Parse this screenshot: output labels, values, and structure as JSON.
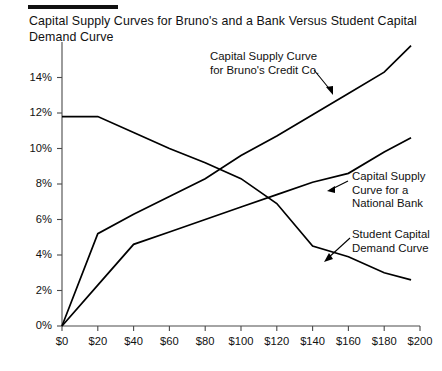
{
  "title": "Capital Supply Curves for Bruno's and a Bank Versus Student Capital Demand Curve",
  "annotations": {
    "bruno": "Capital Supply Curve\nfor Bruno's Credit Co.",
    "bank": "Capital Supply\nCurve for a\nNational Bank",
    "demand": "Student Capital\nDemand Curve"
  },
  "axis": {
    "x_ticks": [
      "$0",
      "$20",
      "$40",
      "$60",
      "$80",
      "$100",
      "$120",
      "$140",
      "$160",
      "$180",
      "$200"
    ],
    "y_ticks": [
      "0%",
      "2%",
      "4%",
      "6%",
      "8%",
      "10%",
      "12%",
      "14%"
    ]
  },
  "chart_data": {
    "type": "line",
    "title": "Capital Supply Curves for Bruno's and a Bank Versus Student Capital Demand Curve",
    "xlabel": "",
    "ylabel": "",
    "xlim": [
      0,
      200
    ],
    "ylim": [
      0,
      16
    ],
    "xtick_values": [
      0,
      20,
      40,
      60,
      80,
      100,
      120,
      140,
      160,
      180,
      200
    ],
    "xtick_labels": [
      "$0",
      "$20",
      "$40",
      "$60",
      "$80",
      "$100",
      "$120",
      "$140",
      "$160",
      "$180",
      "$200"
    ],
    "ytick_values": [
      0,
      2,
      4,
      6,
      8,
      10,
      12,
      14
    ],
    "ytick_labels": [
      "0%",
      "2%",
      "4%",
      "6%",
      "8%",
      "10%",
      "12%",
      "14%"
    ],
    "grid": false,
    "legend": "annotations-with-leader-lines",
    "series": [
      {
        "name": "Capital Supply Curve for Bruno's Credit Co.",
        "x": [
          0,
          20,
          40,
          60,
          80,
          100,
          120,
          140,
          160,
          180,
          195
        ],
        "y": [
          0.0,
          5.2,
          6.3,
          7.3,
          8.3,
          9.6,
          10.7,
          11.9,
          13.1,
          14.3,
          15.8
        ]
      },
      {
        "name": "Capital Supply Curve for a National Bank",
        "x": [
          0,
          20,
          40,
          60,
          80,
          100,
          120,
          140,
          160,
          180,
          195
        ],
        "y": [
          0.0,
          2.3,
          4.6,
          5.3,
          6.0,
          6.7,
          7.4,
          8.1,
          8.6,
          9.8,
          10.6
        ]
      },
      {
        "name": "Student Capital Demand Curve",
        "x": [
          0,
          20,
          40,
          60,
          80,
          100,
          120,
          140,
          160,
          180,
          195
        ],
        "y": [
          11.8,
          11.8,
          10.9,
          10.0,
          9.2,
          8.3,
          6.9,
          4.5,
          3.9,
          3.0,
          2.6
        ]
      }
    ]
  }
}
